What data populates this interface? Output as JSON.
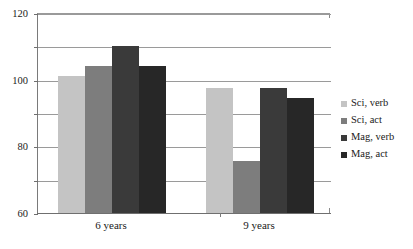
{
  "chart_data": {
    "type": "bar",
    "title": "",
    "xlabel": "",
    "ylabel": "",
    "categories": [
      "6 years",
      "9 years"
    ],
    "series": [
      {
        "name": "Sci, verb",
        "values": [
          82,
          75
        ],
        "color": "#c4c4c4"
      },
      {
        "name": "Sci, act",
        "values": [
          88,
          31
        ],
        "color": "#7d7d7d"
      },
      {
        "name": "Mag, verb",
        "values": [
          100,
          75
        ],
        "color": "#3a3a3a"
      },
      {
        "name": "Mag, act",
        "values": [
          88,
          69
        ],
        "color": "#272727"
      }
    ],
    "ylim": [
      0,
      120
    ],
    "yticks": [
      0,
      20,
      40,
      60,
      80,
      100,
      120
    ],
    "ytick_labels": [
      "0",
      "20",
      "40",
      "60",
      "80",
      "100",
      "120"
    ],
    "grid": true,
    "legend_position": "right"
  },
  "axes": {
    "y": {
      "ticks": [
        {
          "value": 120,
          "label": "120"
        },
        {
          "value": 100,
          "label": "100"
        },
        {
          "value": 80,
          "label": "80"
        },
        {
          "value": 60,
          "label": "60"
        },
        {
          "value": 40,
          "label": "40"
        },
        {
          "value": 20,
          "label": "20"
        },
        {
          "value": 0,
          "label": "0"
        }
      ]
    },
    "x": {
      "categories": [
        {
          "label": "6 years"
        },
        {
          "label": "9 years"
        }
      ]
    }
  },
  "legend": {
    "items": [
      {
        "label": "Sci, verb",
        "color": "#c4c4c4"
      },
      {
        "label": "Sci, act",
        "color": "#7d7d7d"
      },
      {
        "label": "Mag, verb",
        "color": "#3a3a3a"
      },
      {
        "label": "Mag, act",
        "color": "#272727"
      }
    ]
  }
}
